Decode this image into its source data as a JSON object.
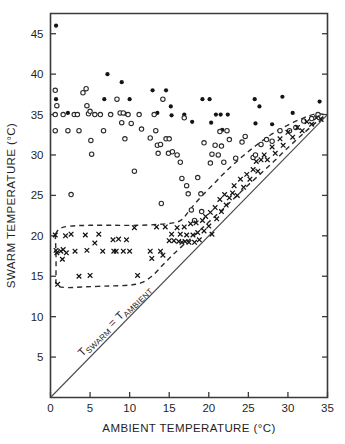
{
  "chart_data": {
    "type": "scatter",
    "title": "",
    "xlabel": "AMBIENT TEMPERATURE  (°C)",
    "ylabel": "SWARM TEMPERATURE (°C)",
    "xlim": [
      0,
      35
    ],
    "ylim": [
      0,
      47.5
    ],
    "xticks": [
      0,
      5,
      10,
      15,
      20,
      25,
      30,
      35
    ],
    "yticks": [
      5,
      10,
      15,
      20,
      25,
      30,
      35,
      40,
      45
    ],
    "xticklabels": [
      "0",
      "5",
      "10",
      "15",
      "20",
      "25",
      "30",
      "35"
    ],
    "yticklabels": [
      "5",
      "10",
      "15",
      "20",
      "25",
      "30",
      "35",
      "40",
      "45"
    ],
    "grid": false,
    "legend": "none",
    "annotations": [
      {
        "name": "identity-line-label",
        "text": "TSWARM = TAMBIENT",
        "text_main": "T",
        "text_sub1": "SWARM",
        "text_mid": " = T",
        "text_sub2": "AMBIENT",
        "x": 4.0,
        "y": 5.0,
        "rotation": -44
      }
    ],
    "reference_lines": [
      {
        "name": "identity-line",
        "label": "Tswarm = Tambient",
        "type": "identity",
        "slope": 1,
        "intercept": 0,
        "style": "solid",
        "from": [
          0,
          0
        ],
        "to": [
          35,
          35
        ]
      }
    ],
    "envelopes": [
      {
        "name": "upper-envelope",
        "style": "dashed",
        "points": [
          [
            0.6,
            20.2
          ],
          [
            1.2,
            20.9
          ],
          [
            2.5,
            21.2
          ],
          [
            5.0,
            21.3
          ],
          [
            8.0,
            21.3
          ],
          [
            11.0,
            21.3
          ],
          [
            13.5,
            21.4
          ],
          [
            15.5,
            21.6
          ],
          [
            16.6,
            22.0
          ],
          [
            17.6,
            23.2
          ],
          [
            19.0,
            24.8
          ],
          [
            20.5,
            26.3
          ],
          [
            22.0,
            27.8
          ],
          [
            24.0,
            29.6
          ],
          [
            26.0,
            31.2
          ],
          [
            28.0,
            32.6
          ],
          [
            30.0,
            33.7
          ],
          [
            32.0,
            34.6
          ],
          [
            33.6,
            35.1
          ],
          [
            34.6,
            35.0
          ]
        ]
      },
      {
        "name": "lower-envelope",
        "style": "dashed",
        "points": [
          [
            0.6,
            20.2
          ],
          [
            0.7,
            17.5
          ],
          [
            0.7,
            15.0
          ],
          [
            0.8,
            13.9
          ],
          [
            2.0,
            13.6
          ],
          [
            4.5,
            13.7
          ],
          [
            7.5,
            13.8
          ],
          [
            10.0,
            13.9
          ],
          [
            11.5,
            14.2
          ],
          [
            12.8,
            15.0
          ],
          [
            14.0,
            16.2
          ],
          [
            15.2,
            17.4
          ],
          [
            16.5,
            18.6
          ],
          [
            18.0,
            19.9
          ],
          [
            20.0,
            21.7
          ],
          [
            22.0,
            23.5
          ],
          [
            24.0,
            25.4
          ],
          [
            26.0,
            27.2
          ],
          [
            28.0,
            29.0
          ],
          [
            30.0,
            30.9
          ],
          [
            32.0,
            32.7
          ],
          [
            34.0,
            34.4
          ],
          [
            34.8,
            35.0
          ]
        ]
      }
    ],
    "series": [
      {
        "name": "filled-circles",
        "marker": "filled-circle",
        "color": "#141414",
        "points": [
          [
            0.7,
            46.0
          ],
          [
            0.7,
            36.9
          ],
          [
            2.2,
            35.2
          ],
          [
            6.8,
            36.9
          ],
          [
            7.2,
            40.0
          ],
          [
            9.0,
            39.0
          ],
          [
            9.1,
            35.2
          ],
          [
            9.5,
            35.1
          ],
          [
            10.0,
            36.9
          ],
          [
            12.9,
            38.0
          ],
          [
            13.5,
            35.2
          ],
          [
            14.2,
            36.9
          ],
          [
            14.6,
            38.0
          ],
          [
            15.2,
            36.0
          ],
          [
            15.3,
            34.9
          ],
          [
            16.9,
            35.0
          ],
          [
            17.9,
            34.1
          ],
          [
            19.2,
            36.9
          ],
          [
            20.1,
            36.9
          ],
          [
            20.3,
            34.0
          ],
          [
            20.9,
            35.0
          ],
          [
            21.5,
            35.0
          ],
          [
            21.7,
            33.1
          ],
          [
            22.4,
            35.0
          ],
          [
            25.8,
            36.9
          ],
          [
            25.9,
            33.9
          ],
          [
            26.4,
            36.0
          ],
          [
            28.0,
            33.8
          ],
          [
            29.3,
            37.2
          ],
          [
            30.6,
            35.2
          ],
          [
            34.0,
            36.6
          ]
        ]
      },
      {
        "name": "open-circles",
        "marker": "open-circle",
        "color": "#2a2a2a",
        "points": [
          [
            0.6,
            38.0
          ],
          [
            0.6,
            35.0
          ],
          [
            0.6,
            33.0
          ],
          [
            0.8,
            36.1
          ],
          [
            1.6,
            35.0
          ],
          [
            2.2,
            33.0
          ],
          [
            2.6,
            25.1
          ],
          [
            3.0,
            35.0
          ],
          [
            3.4,
            35.0
          ],
          [
            3.6,
            33.0
          ],
          [
            4.1,
            37.7
          ],
          [
            4.5,
            38.2
          ],
          [
            4.6,
            36.1
          ],
          [
            4.8,
            35.1
          ],
          [
            5.0,
            35.4
          ],
          [
            5.1,
            31.8
          ],
          [
            5.2,
            30.1
          ],
          [
            5.6,
            35.0
          ],
          [
            6.3,
            35.0
          ],
          [
            6.7,
            33.0
          ],
          [
            7.6,
            35.0
          ],
          [
            8.4,
            36.9
          ],
          [
            8.8,
            35.2
          ],
          [
            9.0,
            34.0
          ],
          [
            9.2,
            35.2
          ],
          [
            9.4,
            32.0
          ],
          [
            9.8,
            35.0
          ],
          [
            10.2,
            33.9
          ],
          [
            10.6,
            28.0
          ],
          [
            11.2,
            35.0
          ],
          [
            11.5,
            33.2
          ],
          [
            12.6,
            32.1
          ],
          [
            13.1,
            35.0
          ],
          [
            13.3,
            33.0
          ],
          [
            13.5,
            31.2
          ],
          [
            13.6,
            30.2
          ],
          [
            13.9,
            31.3
          ],
          [
            14.0,
            24.0
          ],
          [
            14.2,
            36.9
          ],
          [
            14.6,
            32.0
          ],
          [
            14.9,
            30.2
          ],
          [
            15.0,
            32.0
          ],
          [
            15.4,
            30.4
          ],
          [
            16.0,
            30.0
          ],
          [
            16.4,
            29.1
          ],
          [
            16.6,
            27.1
          ],
          [
            16.9,
            34.6
          ],
          [
            17.2,
            26.2
          ],
          [
            17.4,
            25.2
          ],
          [
            17.8,
            23.2
          ],
          [
            18.2,
            21.9
          ],
          [
            18.6,
            27.2
          ],
          [
            19.0,
            25.2
          ],
          [
            19.1,
            23.0
          ],
          [
            19.4,
            31.5
          ],
          [
            20.2,
            29.0
          ],
          [
            20.4,
            30.1
          ],
          [
            20.8,
            31.2
          ],
          [
            21.2,
            30.0
          ],
          [
            21.4,
            32.9
          ],
          [
            21.6,
            31.1
          ],
          [
            21.9,
            29.1
          ],
          [
            22.3,
            33.0
          ],
          [
            22.6,
            31.9
          ],
          [
            23.4,
            29.6
          ],
          [
            24.2,
            31.6
          ],
          [
            24.6,
            32.3
          ],
          [
            25.6,
            29.7
          ],
          [
            25.9,
            30.0
          ],
          [
            26.6,
            31.3
          ],
          [
            27.3,
            31.9
          ],
          [
            28.0,
            31.7
          ],
          [
            29.0,
            33.0
          ],
          [
            30.2,
            33.0
          ],
          [
            31.0,
            33.4
          ],
          [
            32.0,
            34.2
          ],
          [
            33.0,
            34.5
          ],
          [
            33.8,
            35.0
          ]
        ]
      },
      {
        "name": "cross-markers",
        "marker": "x",
        "color": "#141414",
        "points": [
          [
            0.6,
            20.1
          ],
          [
            0.7,
            18.2
          ],
          [
            0.8,
            17.9
          ],
          [
            0.9,
            14.0
          ],
          [
            1.3,
            18.1
          ],
          [
            1.5,
            17.1
          ],
          [
            1.6,
            18.3
          ],
          [
            1.9,
            20.0
          ],
          [
            2.0,
            17.9
          ],
          [
            2.6,
            20.2
          ],
          [
            3.1,
            18.1
          ],
          [
            3.6,
            15.0
          ],
          [
            4.4,
            20.1
          ],
          [
            4.6,
            18.2
          ],
          [
            5.0,
            15.1
          ],
          [
            5.6,
            19.1
          ],
          [
            6.1,
            20.2
          ],
          [
            6.6,
            18.1
          ],
          [
            7.9,
            19.5
          ],
          [
            8.0,
            18.1
          ],
          [
            8.3,
            18.1
          ],
          [
            8.6,
            19.6
          ],
          [
            9.2,
            18.1
          ],
          [
            9.6,
            19.5
          ],
          [
            10.0,
            18.1
          ],
          [
            10.6,
            21.0
          ],
          [
            11.0,
            15.1
          ],
          [
            12.6,
            18.1
          ],
          [
            12.8,
            17.2
          ],
          [
            13.4,
            21.1
          ],
          [
            13.9,
            18.1
          ],
          [
            14.2,
            17.6
          ],
          [
            14.5,
            21.1
          ],
          [
            15.0,
            19.4
          ],
          [
            15.3,
            20.2
          ],
          [
            15.6,
            19.4
          ],
          [
            16.0,
            21.0
          ],
          [
            16.2,
            19.3
          ],
          [
            16.4,
            20.2
          ],
          [
            16.6,
            19.2
          ],
          [
            16.9,
            21.1
          ],
          [
            17.0,
            19.3
          ],
          [
            17.2,
            20.1
          ],
          [
            17.5,
            19.2
          ],
          [
            17.7,
            21.5
          ],
          [
            18.0,
            20.1
          ],
          [
            18.2,
            19.2
          ],
          [
            18.4,
            21.6
          ],
          [
            18.6,
            20.4
          ],
          [
            18.8,
            19.5
          ],
          [
            19.2,
            21.9
          ],
          [
            19.4,
            20.6
          ],
          [
            19.6,
            22.4
          ],
          [
            20.0,
            21.2
          ],
          [
            20.2,
            22.9
          ],
          [
            20.4,
            20.2
          ],
          [
            20.8,
            23.5
          ],
          [
            21.0,
            22.1
          ],
          [
            21.4,
            24.5
          ],
          [
            21.6,
            23.0
          ],
          [
            22.0,
            25.1
          ],
          [
            22.2,
            23.8
          ],
          [
            22.6,
            24.7
          ],
          [
            23.0,
            25.3
          ],
          [
            23.2,
            26.2
          ],
          [
            23.6,
            25.0
          ],
          [
            24.0,
            27.0
          ],
          [
            24.4,
            26.0
          ],
          [
            24.8,
            27.6
          ],
          [
            25.2,
            27.0
          ],
          [
            25.6,
            28.2
          ],
          [
            26.0,
            29.2
          ],
          [
            26.2,
            28.0
          ],
          [
            26.6,
            29.4
          ],
          [
            27.0,
            30.0
          ],
          [
            27.4,
            29.4
          ],
          [
            28.0,
            31.0
          ],
          [
            28.4,
            30.2
          ],
          [
            29.0,
            32.0
          ],
          [
            29.4,
            31.2
          ],
          [
            30.0,
            32.8
          ],
          [
            30.6,
            32.2
          ],
          [
            31.2,
            33.4
          ],
          [
            31.8,
            33.0
          ],
          [
            32.4,
            34.1
          ],
          [
            33.0,
            33.8
          ],
          [
            33.6,
            34.6
          ],
          [
            34.2,
            34.4
          ]
        ]
      }
    ]
  },
  "figure": {
    "background_color": "#ffffff",
    "axis_color": "#3a3a3a",
    "marker_color": "#141414"
  }
}
